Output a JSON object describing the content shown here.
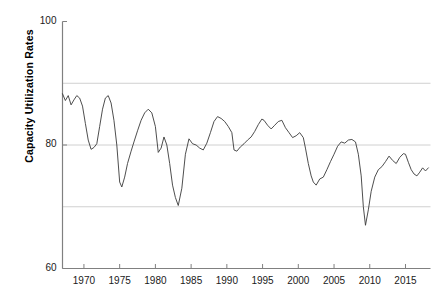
{
  "chart_data": {
    "type": "line",
    "title": "",
    "xlabel": "",
    "ylabel": "Capacity Utilization Rates",
    "xlim": [
      1967.0,
      2018.5
    ],
    "ylim": [
      60,
      100
    ],
    "ytick_labels": [
      "60",
      "80",
      "100"
    ],
    "ytick_values": [
      60,
      80,
      100
    ],
    "gridlines_y": [
      70,
      80,
      90
    ],
    "grid": true,
    "legend": "none",
    "series": [
      {
        "name": "Capacity Utilization Rate",
        "color": "#3a3a3a",
        "x": [
          1967.0,
          1967.4,
          1967.8,
          1968.2,
          1968.6,
          1969.0,
          1969.4,
          1969.8,
          1970.2,
          1970.6,
          1971.0,
          1971.4,
          1971.8,
          1972.2,
          1972.6,
          1973.0,
          1973.4,
          1973.8,
          1974.2,
          1974.6,
          1975.0,
          1975.3,
          1975.7,
          1976.1,
          1976.6,
          1977.0,
          1977.5,
          1978.0,
          1978.5,
          1979.0,
          1979.5,
          1980.0,
          1980.4,
          1980.8,
          1981.2,
          1981.6,
          1982.0,
          1982.4,
          1982.8,
          1983.2,
          1983.7,
          1984.2,
          1984.7,
          1985.2,
          1985.7,
          1986.2,
          1986.7,
          1987.2,
          1987.7,
          1988.2,
          1988.7,
          1989.2,
          1989.7,
          1990.2,
          1990.7,
          1991.0,
          1991.4,
          1991.9,
          1992.4,
          1992.9,
          1993.4,
          1993.9,
          1994.4,
          1994.9,
          1995.2,
          1995.7,
          1996.2,
          1996.7,
          1997.2,
          1997.7,
          1998.2,
          1998.7,
          1999.2,
          1999.7,
          2000.2,
          2000.7,
          2001.0,
          2001.4,
          2001.8,
          2002.1,
          2002.5,
          2003.0,
          2003.5,
          2004.0,
          2004.5,
          2005.0,
          2005.5,
          2006.0,
          2006.5,
          2007.0,
          2007.5,
          2008.0,
          2008.4,
          2008.8,
          2009.1,
          2009.4,
          2009.8,
          2010.2,
          2010.7,
          2011.2,
          2011.7,
          2012.2,
          2012.7,
          2013.2,
          2013.7,
          2014.2,
          2014.7,
          2015.0,
          2015.4,
          2015.8,
          2016.2,
          2016.6,
          2017.0,
          2017.4,
          2017.8,
          2018.2
        ],
        "y": [
          88.3,
          87.2,
          88.0,
          86.5,
          87.3,
          88.0,
          87.6,
          86.3,
          83.5,
          80.8,
          79.3,
          79.6,
          80.2,
          83.0,
          85.8,
          87.6,
          88.0,
          86.8,
          84.0,
          80.0,
          74.0,
          73.2,
          74.8,
          77.0,
          79.0,
          80.5,
          82.3,
          84.0,
          85.2,
          85.8,
          85.2,
          83.0,
          78.8,
          79.5,
          81.3,
          80.0,
          77.0,
          73.5,
          71.5,
          70.2,
          73.0,
          78.5,
          81.0,
          80.2,
          80.0,
          79.5,
          79.2,
          80.3,
          82.0,
          83.8,
          84.6,
          84.3,
          83.8,
          83.0,
          82.0,
          79.2,
          79.0,
          79.7,
          80.2,
          80.8,
          81.3,
          82.2,
          83.3,
          84.2,
          84.0,
          83.2,
          82.6,
          83.2,
          83.8,
          84.0,
          82.8,
          82.0,
          81.2,
          81.5,
          82.0,
          81.2,
          79.5,
          77.0,
          75.0,
          74.0,
          73.5,
          74.5,
          74.8,
          76.0,
          77.3,
          78.5,
          79.8,
          80.5,
          80.3,
          80.8,
          80.9,
          80.5,
          78.5,
          75.0,
          70.0,
          67.0,
          69.5,
          72.5,
          74.8,
          76.0,
          76.5,
          77.3,
          78.2,
          77.5,
          77.0,
          78.0,
          78.6,
          78.5,
          77.2,
          76.0,
          75.3,
          75.0,
          75.6,
          76.3,
          75.8,
          76.3
        ]
      }
    ]
  },
  "axes": {
    "y_label": "Capacity Utilization Rates",
    "y_ticks": [
      {
        "label": "100",
        "value": 100
      },
      {
        "label": "80",
        "value": 80
      },
      {
        "label": "60",
        "value": 60
      }
    ],
    "x_ticks": [
      {
        "label": "1970",
        "value": 1970
      },
      {
        "label": "1975",
        "value": 1975
      },
      {
        "label": "1980",
        "value": 1980
      },
      {
        "label": "1985",
        "value": 1985
      },
      {
        "label": "1990",
        "value": 1990
      },
      {
        "label": "1995",
        "value": 1995
      },
      {
        "label": "2000",
        "value": 2000
      },
      {
        "label": "2005",
        "value": 2005
      },
      {
        "label": "2010",
        "value": 2010
      },
      {
        "label": "2015",
        "value": 2015
      }
    ]
  },
  "style": {
    "line_color": "#3a3a3a",
    "axis_color": "#808080",
    "grid_color": "#d0d0d0",
    "background": "#ffffff",
    "text_color": "#1a1a1a"
  }
}
